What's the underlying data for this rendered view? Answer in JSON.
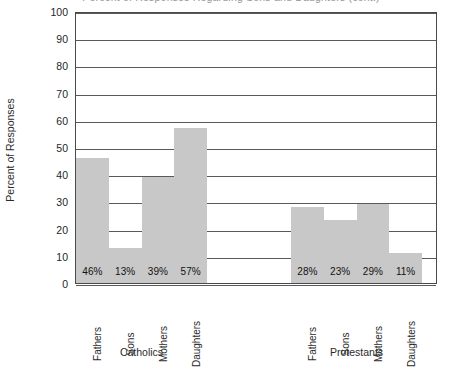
{
  "chart_data": {
    "type": "bar",
    "title": "Percent of Responses Regarding Sons and Daughters (cont.)",
    "xlabel": "",
    "ylabel": "Percent of Responses",
    "ylim": [
      0,
      100
    ],
    "ytick_step": 10,
    "ytick_labels": [
      "100",
      "90",
      "80",
      "70",
      "60",
      "50",
      "40",
      "30",
      "20",
      "10",
      "0"
    ],
    "grid": "horizontal",
    "legend": "none",
    "bar_color": "#c8c8c8",
    "categories": [
      "Fathers",
      "Sons",
      "Mothers",
      "Daughters"
    ],
    "groups": [
      {
        "name": "Catholics",
        "bars": [
          {
            "category": "Fathers",
            "value": 46,
            "label": "46%"
          },
          {
            "category": "Sons",
            "value": 13,
            "label": "13%"
          },
          {
            "category": "Mothers",
            "value": 39,
            "label": "39%"
          },
          {
            "category": "Daughters",
            "value": 57,
            "label": "57%"
          }
        ]
      },
      {
        "name": "Protestants",
        "bars": [
          {
            "category": "Fathers",
            "value": 28,
            "label": "28%"
          },
          {
            "category": "Sons",
            "value": 23,
            "label": "23%"
          },
          {
            "category": "Mothers",
            "value": 29,
            "label": "29%"
          },
          {
            "category": "Daughters",
            "value": 11,
            "label": "11%"
          }
        ]
      }
    ]
  }
}
